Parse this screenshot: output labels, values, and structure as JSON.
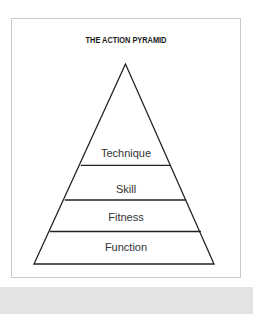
{
  "diagram": {
    "title": "THE ACTION PYRAMID",
    "type": "pyramid",
    "levels_top_to_bottom": [
      {
        "label": "Technique"
      },
      {
        "label": "Skill"
      },
      {
        "label": "Fitness"
      },
      {
        "label": "Function"
      }
    ],
    "colors": {
      "stroke": "#222222",
      "frame_border": "#c8c8c8",
      "footer_band": "#e3e3e3",
      "text": "#333333"
    }
  }
}
